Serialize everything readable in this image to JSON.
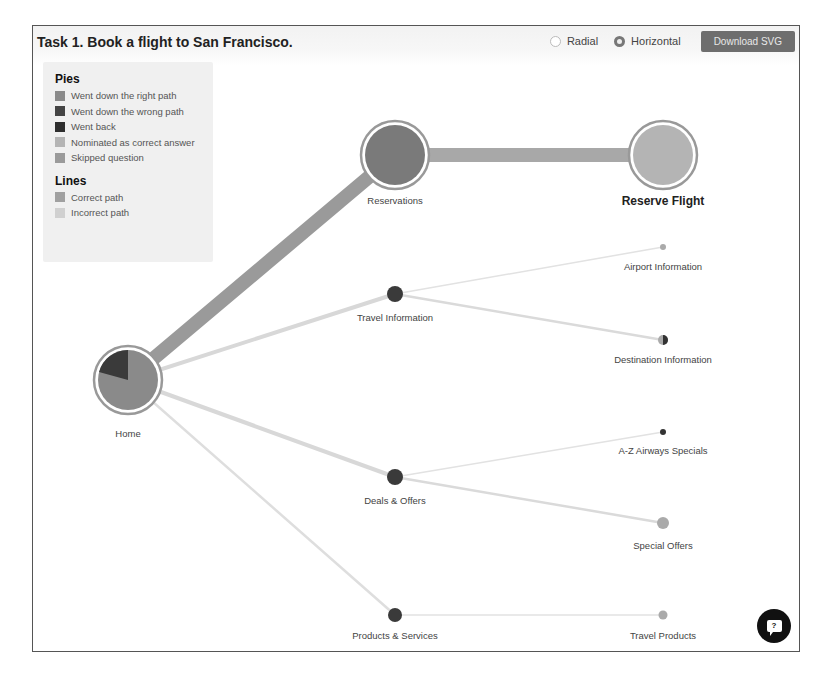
{
  "header": {
    "title": "Task 1. Book a flight to San Francisco.",
    "layout_options": [
      {
        "label": "Radial",
        "checked": false
      },
      {
        "label": "Horizontal",
        "checked": true
      }
    ],
    "download_label": "Download SVG"
  },
  "legend": {
    "pies_title": "Pies",
    "pies": [
      {
        "label": "Went down the right path",
        "color": "#8a8a8a"
      },
      {
        "label": "Went down the wrong path",
        "color": "#444444"
      },
      {
        "label": "Went back",
        "color": "#2e2e2e"
      },
      {
        "label": "Nominated as correct answer",
        "color": "#b4b4b4"
      },
      {
        "label": "Skipped question",
        "color": "#9a9a9a"
      }
    ],
    "lines_title": "Lines",
    "lines": [
      {
        "label": "Correct path",
        "color": "#a0a0a0"
      },
      {
        "label": "Incorrect path",
        "color": "#d0d0d0"
      }
    ]
  },
  "tree": {
    "nodes": [
      {
        "id": "home",
        "label": "Home"
      },
      {
        "id": "reservations",
        "label": "Reservations"
      },
      {
        "id": "reserve_flight",
        "label": "Reserve Flight"
      },
      {
        "id": "travel_information",
        "label": "Travel Information"
      },
      {
        "id": "airport_information",
        "label": "Airport Information"
      },
      {
        "id": "destination_information",
        "label": "Destination Information"
      },
      {
        "id": "deals_offers",
        "label": "Deals & Offers"
      },
      {
        "id": "az_airways_specials",
        "label": "A-Z Airways Specials"
      },
      {
        "id": "special_offers",
        "label": "Special Offers"
      },
      {
        "id": "products_services",
        "label": "Products & Services"
      },
      {
        "id": "travel_products",
        "label": "Travel Products"
      }
    ]
  },
  "help": {
    "icon": "?"
  }
}
